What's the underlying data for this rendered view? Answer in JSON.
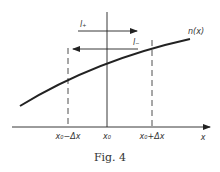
{
  "figure": {
    "caption": "Fig. 4",
    "curve_label": "n(x)",
    "axis_label": "x",
    "ticks": {
      "left": "x₀−Δx",
      "center": "x₀",
      "right": "x₀+Δx"
    },
    "arrows": {
      "upper": "l₊",
      "lower": "l₋"
    },
    "colors": {
      "ink": "#222222",
      "background": "#ffffff"
    }
  }
}
